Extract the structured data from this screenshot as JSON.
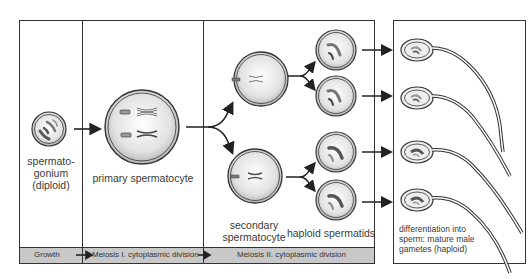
{
  "diagram": {
    "type": "spermatogenesis-flow",
    "stages": [
      {
        "id": "spermatogonium",
        "label": "spermato-\ngonium\n(diploid)",
        "line1": "spermato-",
        "line2": "gonium",
        "line3": "(diploid)"
      },
      {
        "id": "primary",
        "label": "primary spermatocyte"
      },
      {
        "id": "secondary",
        "label_line1": "secondary",
        "label_line2": "spermatocyte"
      },
      {
        "id": "spermatids",
        "label": "haploid spermatids"
      },
      {
        "id": "sperm",
        "line1": "differentiation into",
        "line2": "sperm: mature male",
        "line3": "gametes (haploid)"
      }
    ],
    "phases": [
      {
        "label": "Growth"
      },
      {
        "label": "Meiosis I. cytoplasmic division"
      },
      {
        "label": "Meiosis II. cytoplasmic division"
      }
    ],
    "colors": {
      "line": "#222222",
      "band": "#c8c8c8",
      "cell_fill": "#e6e6e6",
      "chromosome": "#555555"
    }
  }
}
